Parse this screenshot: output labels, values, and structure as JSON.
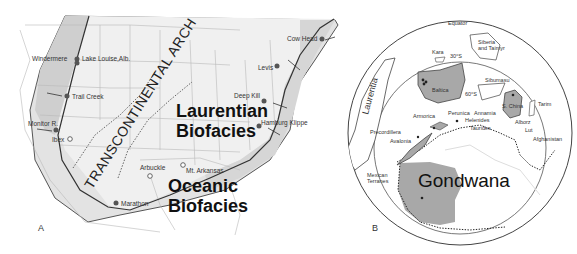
{
  "figure": {
    "panels": [
      {
        "id": "A",
        "label": "A",
        "title_regions": {
          "arch": "TRANSCONTINENTAL ARCH",
          "laurentian_line1": "Laurentian",
          "laurentian_line2": "Biofacies",
          "oceanic_line1": "Oceanic",
          "oceanic_line2": "Biofacies"
        },
        "localities_filled": [
          "Windermere",
          "Lake Louise,Alb.",
          "Trail Creek",
          "Monitor R.",
          "Marathon",
          "Cow Head",
          "Levis",
          "Deep Kill",
          "Hamburg Klippe"
        ],
        "localities_open": [
          "Ibex",
          "Arbuckle",
          "Mt. Arkansas"
        ],
        "labels": {
          "windermere": "Windermere",
          "lake_louise": "Lake Louise,Alb.",
          "trail_creek": "Trail Creek",
          "monitor": "Monitor R.",
          "ibex": "Ibex",
          "arbuckle": "Arbuckle",
          "mt_arkansas": "Mt. Arkansas",
          "marathon": "Marathon",
          "cow_head": "Cow Head",
          "levis": "Levis",
          "deep_kill": "Deep Kill",
          "hamburg": "Hamburg Klippe"
        }
      },
      {
        "id": "B",
        "label": "B",
        "labels": {
          "equator": "Equator",
          "lat30": "30°S",
          "lat60": "60°S",
          "laurentia": "Laurentia",
          "kara": "Kara",
          "siberia1": "Siberia",
          "siberia2": "and Taimyr",
          "baltica": "Baltica",
          "sibumasu": "Sibumasu",
          "s_china": "S. China",
          "tarim": "Tarim",
          "precordillera": "Precordillera",
          "avalonia": "Avalonia",
          "armorica": "Armorica",
          "perunica": "Perunica",
          "annamia": "Annamia",
          "helenides": "Helenides",
          "taurides": "Taurides",
          "alborz": "Alborz",
          "lut": "Lut",
          "afghanistan": "Afghanistan",
          "mexican1": "Mexican",
          "mexican2": "Terranes",
          "gondwana": "Gondwana"
        }
      }
    ],
    "colors": {
      "shade_light": "#e6e6e6",
      "shade_mid": "#d2d2d2",
      "shade_dark": "#b9b9b9",
      "continent_fill": "#a8a8a8",
      "line": "#444444",
      "border": "#9a9a9a"
    }
  }
}
